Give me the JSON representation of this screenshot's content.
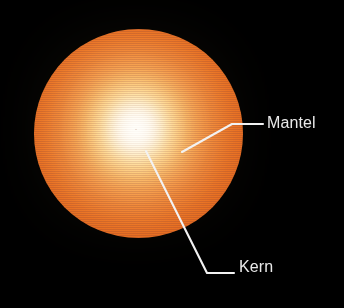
{
  "figure": {
    "background_color": "#000000",
    "width": 344,
    "height": 308
  },
  "star": {
    "name": "star",
    "core_label": "Kern",
    "mantle_label": "Mantel",
    "core_color": "#ffffff",
    "inner_color": "#ffd488",
    "mid_color": "#f59442",
    "outer_color": "#de5f17",
    "center_x": 138,
    "center_y": 133,
    "radius": 104
  },
  "labels": [
    {
      "id": "mantel",
      "text": "Mantel",
      "color": "#e9e9e9",
      "x": 267,
      "y": 115,
      "leader": {
        "color": "#f2f2f2",
        "points": "182,152 232,124 263,124",
        "anchor_x": 182,
        "anchor_y": 152
      }
    },
    {
      "id": "kern",
      "text": "Kern",
      "color": "#e9e9e9",
      "x": 239,
      "y": 259,
      "leader": {
        "color": "#f2f2f2",
        "points": "146,151 207,273 234,273",
        "anchor_x": 146,
        "anchor_y": 151
      }
    }
  ]
}
